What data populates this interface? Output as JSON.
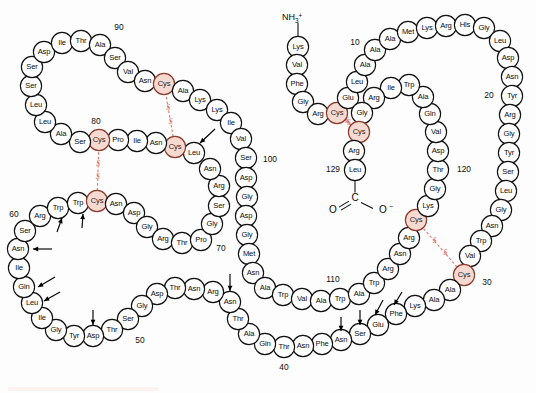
{
  "figure": {
    "molecule": "Hen egg-white lysozyme",
    "residue_count": 129,
    "n_terminus_label": "NH",
    "n_terminus_sub": "3",
    "n_terminus_sup": "+",
    "c_terminus_carbon": "C",
    "c_terminus_o_left": "O",
    "c_terminus_o_right": "O",
    "c_terminus_charge": "−",
    "ss_label_left": "S",
    "ss_label_right": "S",
    "colors": {
      "cysteine_fill": "#f6d9d1",
      "cysteine_stroke": "#8c3b2c",
      "disulfide": "#e2796a",
      "residue_stroke": "#111111",
      "background": "#fdfdfd"
    }
  },
  "residues": [
    {
      "n": 1,
      "name": "Lys",
      "x": 298,
      "y": 47
    },
    {
      "n": 2,
      "name": "Val",
      "x": 297,
      "y": 65
    },
    {
      "n": 3,
      "name": "Phe",
      "x": 297,
      "y": 84
    },
    {
      "n": 4,
      "name": "Gly",
      "x": 303,
      "y": 102
    },
    {
      "n": 5,
      "name": "Arg",
      "x": 318,
      "y": 114
    },
    {
      "n": 6,
      "name": "Cys",
      "x": 337,
      "y": 113,
      "cys": true
    },
    {
      "n": 7,
      "name": "Glu",
      "x": 348,
      "y": 98
    },
    {
      "n": 8,
      "name": "Leu",
      "x": 357,
      "y": 82
    },
    {
      "n": 9,
      "name": "Ala",
      "x": 365,
      "y": 65
    },
    {
      "n": 10,
      "name": "Ala",
      "x": 375,
      "y": 50
    },
    {
      "n": 11,
      "name": "Ala",
      "x": 390,
      "y": 39
    },
    {
      "n": 12,
      "name": "Met",
      "x": 408,
      "y": 32
    },
    {
      "n": 13,
      "name": "Lys",
      "x": 427,
      "y": 28
    },
    {
      "n": 14,
      "name": "Arg",
      "x": 446,
      "y": 26
    },
    {
      "n": 15,
      "name": "His",
      "x": 465,
      "y": 25
    },
    {
      "n": 16,
      "name": "Gly",
      "x": 484,
      "y": 28
    },
    {
      "n": 17,
      "name": "Leu",
      "x": 500,
      "y": 41
    },
    {
      "n": 18,
      "name": "Asp",
      "x": 508,
      "y": 58
    },
    {
      "n": 19,
      "name": "Asn",
      "x": 512,
      "y": 77
    },
    {
      "n": 20,
      "name": "Tyr",
      "x": 512,
      "y": 96
    },
    {
      "n": 21,
      "name": "Arg",
      "x": 510,
      "y": 115
    },
    {
      "n": 22,
      "name": "Gly",
      "x": 509,
      "y": 134
    },
    {
      "n": 23,
      "name": "Tyr",
      "x": 509,
      "y": 153
    },
    {
      "n": 24,
      "name": "Ser",
      "x": 508,
      "y": 172
    },
    {
      "n": 25,
      "name": "Leu",
      "x": 506,
      "y": 191
    },
    {
      "n": 26,
      "name": "Gly",
      "x": 501,
      "y": 210
    },
    {
      "n": 27,
      "name": "Asn",
      "x": 492,
      "y": 226
    },
    {
      "n": 28,
      "name": "Trp",
      "x": 481,
      "y": 241
    },
    {
      "n": 29,
      "name": "Val",
      "x": 470,
      "y": 256
    },
    {
      "n": 30,
      "name": "Cys",
      "x": 464,
      "y": 275,
      "cys": true
    },
    {
      "n": 31,
      "name": "Ala",
      "x": 450,
      "y": 290
    },
    {
      "n": 32,
      "name": "Ala",
      "x": 434,
      "y": 300
    },
    {
      "n": 33,
      "name": "Lys",
      "x": 415,
      "y": 306
    },
    {
      "n": 34,
      "name": "Phe",
      "x": 396,
      "y": 314
    },
    {
      "n": 35,
      "name": "Glu",
      "x": 378,
      "y": 325
    },
    {
      "n": 36,
      "name": "Ser",
      "x": 360,
      "y": 334
    },
    {
      "n": 37,
      "name": "Asn",
      "x": 341,
      "y": 340
    },
    {
      "n": 38,
      "name": "Phe",
      "x": 322,
      "y": 344
    },
    {
      "n": 39,
      "name": "Asn",
      "x": 303,
      "y": 346
    },
    {
      "n": 40,
      "name": "Thr",
      "x": 284,
      "y": 347
    },
    {
      "n": 41,
      "name": "Gln",
      "x": 265,
      "y": 344
    },
    {
      "n": 42,
      "name": "Ala",
      "x": 249,
      "y": 334
    },
    {
      "n": 43,
      "name": "Thr",
      "x": 238,
      "y": 319
    },
    {
      "n": 44,
      "name": "Asn",
      "x": 230,
      "y": 302
    },
    {
      "n": 45,
      "name": "Arg",
      "x": 213,
      "y": 292
    },
    {
      "n": 46,
      "name": "Asn",
      "x": 194,
      "y": 289
    },
    {
      "n": 47,
      "name": "Thr",
      "x": 175,
      "y": 288
    },
    {
      "n": 48,
      "name": "Asp",
      "x": 157,
      "y": 294
    },
    {
      "n": 49,
      "name": "Gly",
      "x": 142,
      "y": 306
    },
    {
      "n": 50,
      "name": "Ser",
      "x": 128,
      "y": 319
    },
    {
      "n": 51,
      "name": "Thr",
      "x": 112,
      "y": 330
    },
    {
      "n": 52,
      "name": "Asp",
      "x": 93,
      "y": 336
    },
    {
      "n": 53,
      "name": "Tyr",
      "x": 74,
      "y": 336
    },
    {
      "n": 54,
      "name": "Gly",
      "x": 56,
      "y": 330
    },
    {
      "n": 55,
      "name": "Ile",
      "x": 42,
      "y": 318
    },
    {
      "n": 56,
      "name": "Leu",
      "x": 32,
      "y": 303
    },
    {
      "n": 57,
      "name": "Gln",
      "x": 24,
      "y": 287
    },
    {
      "n": 58,
      "name": "Ile",
      "x": 19,
      "y": 268
    },
    {
      "n": 59,
      "name": "Asn",
      "x": 18,
      "y": 249
    },
    {
      "n": 60,
      "name": "Ser",
      "x": 25,
      "y": 231
    },
    {
      "n": 61,
      "name": "Arg",
      "x": 40,
      "y": 216
    },
    {
      "n": 62,
      "name": "Trp",
      "x": 58,
      "y": 208
    },
    {
      "n": 63,
      "name": "Trp",
      "x": 78,
      "y": 203
    },
    {
      "n": 64,
      "name": "Cys",
      "x": 97,
      "y": 201,
      "cys": true
    },
    {
      "n": 65,
      "name": "Asn",
      "x": 116,
      "y": 204
    },
    {
      "n": 66,
      "name": "Asp",
      "x": 134,
      "y": 213
    },
    {
      "n": 67,
      "name": "Gly",
      "x": 147,
      "y": 227
    },
    {
      "n": 68,
      "name": "Arg",
      "x": 163,
      "y": 239
    },
    {
      "n": 69,
      "name": "Thr",
      "x": 182,
      "y": 243
    },
    {
      "n": 70,
      "name": "Pro",
      "x": 201,
      "y": 240
    },
    {
      "n": 71,
      "name": "Gly",
      "x": 212,
      "y": 224
    },
    {
      "n": 72,
      "name": "Ser",
      "x": 219,
      "y": 206
    },
    {
      "n": 73,
      "name": "Arg",
      "x": 219,
      "y": 186
    },
    {
      "n": 74,
      "name": "Asn",
      "x": 210,
      "y": 169
    },
    {
      "n": 75,
      "name": "Leu",
      "x": 194,
      "y": 153
    },
    {
      "n": 76,
      "name": "Cys",
      "x": 175,
      "y": 147,
      "cys": true
    },
    {
      "n": 77,
      "name": "Asn",
      "x": 156,
      "y": 143
    },
    {
      "n": 78,
      "name": "Ile",
      "x": 137,
      "y": 141
    },
    {
      "n": 79,
      "name": "Pro",
      "x": 118,
      "y": 140
    },
    {
      "n": 80,
      "name": "Cys",
      "x": 99,
      "y": 140,
      "cys": true
    },
    {
      "n": 81,
      "name": "Ser",
      "x": 80,
      "y": 142
    },
    {
      "n": 82,
      "name": "Ala",
      "x": 61,
      "y": 134
    },
    {
      "n": 83,
      "name": "Leu",
      "x": 45,
      "y": 122
    },
    {
      "n": 84,
      "name": "Leu",
      "x": 36,
      "y": 105
    },
    {
      "n": 85,
      "name": "Ser",
      "x": 31,
      "y": 86
    },
    {
      "n": 86,
      "name": "Ser",
      "x": 32,
      "y": 67
    },
    {
      "n": 87,
      "name": "Asp",
      "x": 44,
      "y": 52
    },
    {
      "n": 88,
      "name": "Ile",
      "x": 62,
      "y": 43
    },
    {
      "n": 89,
      "name": "Thr",
      "x": 81,
      "y": 41
    },
    {
      "n": 90,
      "name": "Ala",
      "x": 100,
      "y": 45
    },
    {
      "n": 91,
      "name": "Ser",
      "x": 115,
      "y": 58
    },
    {
      "n": 92,
      "name": "Val",
      "x": 128,
      "y": 72
    },
    {
      "n": 93,
      "name": "Asn",
      "x": 145,
      "y": 81
    },
    {
      "n": 94,
      "name": "Cys",
      "x": 164,
      "y": 84,
      "cys": true
    },
    {
      "n": 95,
      "name": "Ala",
      "x": 183,
      "y": 91
    },
    {
      "n": 96,
      "name": "Lys",
      "x": 200,
      "y": 100
    },
    {
      "n": 97,
      "name": "Lys",
      "x": 217,
      "y": 110
    },
    {
      "n": 98,
      "name": "Ile",
      "x": 231,
      "y": 123
    },
    {
      "n": 99,
      "name": "Val",
      "x": 241,
      "y": 139
    },
    {
      "n": 100,
      "name": "Ser",
      "x": 246,
      "y": 158
    },
    {
      "n": 101,
      "name": "Asp",
      "x": 246,
      "y": 178
    },
    {
      "n": 102,
      "name": "Gly",
      "x": 247,
      "y": 197
    },
    {
      "n": 103,
      "name": "Asp",
      "x": 246,
      "y": 216
    },
    {
      "n": 104,
      "name": "Gly",
      "x": 247,
      "y": 235
    },
    {
      "n": 105,
      "name": "Met",
      "x": 249,
      "y": 254
    },
    {
      "n": 106,
      "name": "Asn",
      "x": 253,
      "y": 273
    },
    {
      "n": 107,
      "name": "Ala",
      "x": 265,
      "y": 288
    },
    {
      "n": 108,
      "name": "Trp",
      "x": 283,
      "y": 295
    },
    {
      "n": 109,
      "name": "Val",
      "x": 302,
      "y": 299
    },
    {
      "n": 110,
      "name": "Ala",
      "x": 321,
      "y": 301
    },
    {
      "n": 111,
      "name": "Trp",
      "x": 340,
      "y": 299
    },
    {
      "n": 112,
      "name": "Ala",
      "x": 359,
      "y": 294
    },
    {
      "n": 113,
      "name": "Trp",
      "x": 374,
      "y": 283
    },
    {
      "n": 114,
      "name": "Arg",
      "x": 388,
      "y": 269
    },
    {
      "n": 115,
      "name": "Asn",
      "x": 400,
      "y": 254
    },
    {
      "n": 116,
      "name": "Arg",
      "x": 409,
      "y": 238
    },
    {
      "n": 117,
      "name": "Cys",
      "x": 416,
      "y": 220,
      "cys": true
    },
    {
      "n": 118,
      "name": "Lys",
      "x": 428,
      "y": 206
    },
    {
      "n": 119,
      "name": "Gly",
      "x": 435,
      "y": 189
    },
    {
      "n": 120,
      "name": "Thr",
      "x": 438,
      "y": 170
    },
    {
      "n": 121,
      "name": "Asp",
      "x": 438,
      "y": 151
    },
    {
      "n": 122,
      "name": "Val",
      "x": 436,
      "y": 132
    },
    {
      "n": 123,
      "name": "Gln",
      "x": 430,
      "y": 114
    },
    {
      "n": 124,
      "name": "Ala",
      "x": 423,
      "y": 97
    },
    {
      "n": 125,
      "name": "Trp",
      "x": 409,
      "y": 85
    },
    {
      "n": 126,
      "name": "Ile",
      "x": 391,
      "y": 88
    },
    {
      "n": 127,
      "name": "Arg",
      "x": 374,
      "y": 98
    },
    {
      "n": 128,
      "name": "Gly",
      "x": 362,
      "y": 113
    },
    {
      "n": 129,
      "name": "Cys",
      "x": 359,
      "y": 132,
      "cys": true
    },
    {
      "n": 130,
      "name": "Arg",
      "x": 354,
      "y": 151
    },
    {
      "n": 131,
      "name": "Leu",
      "x": 355,
      "y": 170
    }
  ],
  "chain_breaks": [
    129
  ],
  "number_labels": [
    {
      "text": "10",
      "x": 355,
      "y": 43
    },
    {
      "text": "20",
      "x": 489,
      "y": 96
    },
    {
      "text": "30",
      "x": 487,
      "y": 283
    },
    {
      "text": "40",
      "x": 284,
      "y": 368
    },
    {
      "text": "50",
      "x": 140,
      "y": 341
    },
    {
      "text": "60",
      "x": 14,
      "y": 215
    },
    {
      "text": "70",
      "x": 221,
      "y": 249
    },
    {
      "text": "80",
      "x": 96,
      "y": 122
    },
    {
      "text": "90",
      "x": 119,
      "y": 28
    },
    {
      "text": "100",
      "x": 270,
      "y": 160
    },
    {
      "text": "110",
      "x": 333,
      "y": 280
    },
    {
      "text": "120",
      "x": 464,
      "y": 170
    },
    {
      "text": "129",
      "x": 333,
      "y": 170
    }
  ],
  "disulfide_bonds": [
    {
      "from": 6,
      "to": 129,
      "label": "Cys6-Cys127"
    },
    {
      "from": 30,
      "to": 117,
      "label": "Cys30-Cys115"
    },
    {
      "from": 64,
      "to": 80,
      "label": "Cys64-Cys80"
    },
    {
      "from": 76,
      "to": 94,
      "label": "Cys76-Cys94"
    }
  ],
  "arrows": [
    {
      "name": "arrow-leu75",
      "x1": 215,
      "y1": 129,
      "x2": 200,
      "y2": 143
    },
    {
      "name": "arrow-trp62",
      "x1": 57,
      "y1": 232,
      "x2": 62,
      "y2": 218
    },
    {
      "name": "arrow-trp63",
      "x1": 82,
      "y1": 228,
      "x2": 83,
      "y2": 214
    },
    {
      "name": "arrow-asn59",
      "x1": 52,
      "y1": 249,
      "x2": 33,
      "y2": 249
    },
    {
      "name": "arrow-gln57",
      "x1": 55,
      "y1": 277,
      "x2": 38,
      "y2": 287
    },
    {
      "name": "arrow-leu56",
      "x1": 60,
      "y1": 292,
      "x2": 44,
      "y2": 301
    },
    {
      "name": "arrow-asp52",
      "x1": 93,
      "y1": 310,
      "x2": 93,
      "y2": 325
    },
    {
      "name": "arrow-asn44",
      "x1": 230,
      "y1": 274,
      "x2": 230,
      "y2": 291
    },
    {
      "name": "arrow-asn37",
      "x1": 341,
      "y1": 317,
      "x2": 341,
      "y2": 331
    },
    {
      "name": "arrow-ser36",
      "x1": 360,
      "y1": 310,
      "x2": 360,
      "y2": 325
    },
    {
      "name": "arrow-glu35",
      "x1": 383,
      "y1": 300,
      "x2": 375,
      "y2": 315
    },
    {
      "name": "arrow-phe34",
      "x1": 402,
      "y1": 292,
      "x2": 394,
      "y2": 305
    }
  ]
}
